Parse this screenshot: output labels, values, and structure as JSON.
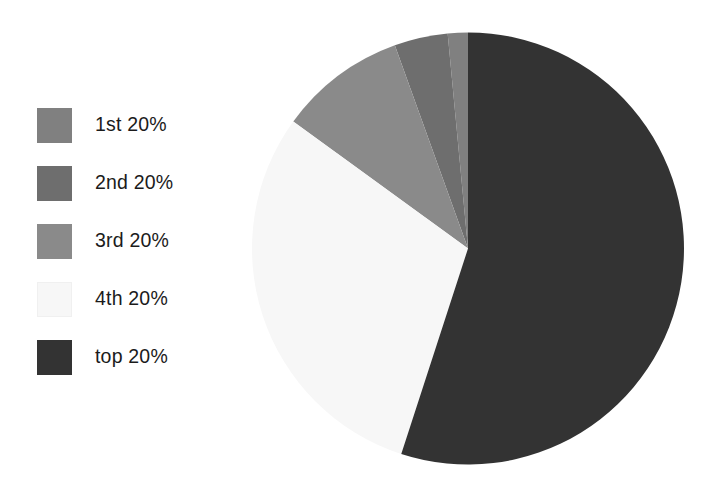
{
  "chart_data": {
    "type": "pie",
    "title": "",
    "subtitle": "",
    "xlabel": "",
    "ylabel": "",
    "grid": false,
    "legend_position": "left",
    "start_angle_deg": 0,
    "direction": "clockwise",
    "center": {
      "x": 468,
      "y": 248
    },
    "radius": 216,
    "categories": [
      "1st 20%",
      "2nd 20%",
      "3rd 20%",
      "4th 20%",
      "top 20%"
    ],
    "values": [
      1.5,
      4.0,
      9.5,
      30.0,
      55.0
    ],
    "value_unit": "percent",
    "colors": [
      "#808080",
      "#6e6e6e",
      "#8a8a8a",
      "#f7f7f7",
      "#333333"
    ],
    "slices": [
      {
        "label": "1st 20%",
        "value": 1.5,
        "color": "#808080",
        "start_deg": 354.6,
        "end_deg": 360.0
      },
      {
        "label": "2nd 20%",
        "value": 4.0,
        "color": "#6e6e6e",
        "start_deg": 340.2,
        "end_deg": 354.6
      },
      {
        "label": "3rd 20%",
        "value": 9.5,
        "color": "#8a8a8a",
        "start_deg": 306.0,
        "end_deg": 340.2
      },
      {
        "label": "4th 20%",
        "value": 30.0,
        "color": "#f7f7f7",
        "start_deg": 198.0,
        "end_deg": 306.0
      },
      {
        "label": "top 20%",
        "value": 55.0,
        "color": "#333333",
        "start_deg": 0.0,
        "end_deg": 198.0
      }
    ]
  },
  "legend": {
    "items": [
      {
        "label": "1st 20%",
        "color": "#808080"
      },
      {
        "label": "2nd 20%",
        "color": "#6e6e6e"
      },
      {
        "label": "3rd 20%",
        "color": "#8a8a8a"
      },
      {
        "label": "4th 20%",
        "color": "#f7f7f7"
      },
      {
        "label": "top 20%",
        "color": "#333333"
      }
    ]
  },
  "canvas": {
    "background": "#ffffff"
  }
}
